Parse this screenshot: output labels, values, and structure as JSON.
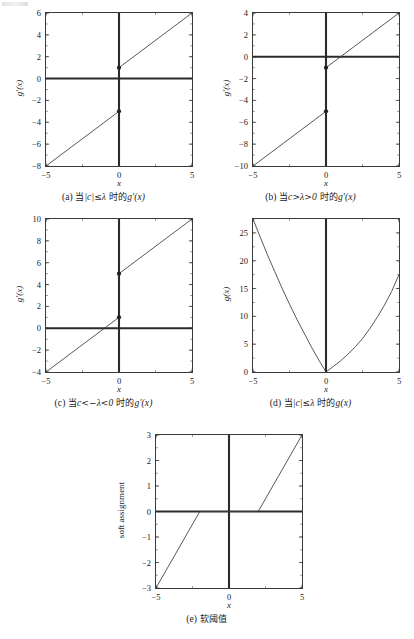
{
  "figure": {
    "title_visible": false,
    "panel_count": 5,
    "line_color": "#3a3a3a",
    "axis_color": "#2b2b2b",
    "marker_color": "#222222"
  },
  "panels": [
    {
      "id": "a",
      "tag": "(a)",
      "caption_parts": [
        "(a)",
        "当",
        "|c|≤λ",
        "时的",
        "g'(x)"
      ],
      "caption": "(a) 当|c|≤λ 时的g'(x)",
      "xlabel": "x",
      "ylabel": "g'(x)",
      "xticks": [
        "-5",
        "0",
        "5"
      ],
      "yticks": [
        "6",
        "4",
        "2",
        "0",
        "-2",
        "-4",
        "-6",
        "-8"
      ],
      "xlim": [
        -5,
        5
      ],
      "ylim": [
        -8,
        6
      ]
    },
    {
      "id": "b",
      "tag": "(b)",
      "caption_parts": [
        "(b)",
        "当",
        "c>λ>0",
        "时的",
        "g'(x)"
      ],
      "caption": "(b) 当c>λ>0 时的g'(x)",
      "xlabel": "x",
      "ylabel": "g'(x)",
      "xticks": [
        "-5",
        "0",
        "5"
      ],
      "yticks": [
        "4",
        "2",
        "0",
        "-2",
        "-4",
        "-6",
        "-8",
        "-10"
      ],
      "xlim": [
        -5,
        5
      ],
      "ylim": [
        -10,
        4
      ]
    },
    {
      "id": "c",
      "tag": "(c)",
      "caption_parts": [
        "(c)",
        "当",
        "c<-λ<0",
        "时的",
        "g'(x)"
      ],
      "caption": "(c) 当c<-λ<0 时的g'(x)",
      "xlabel": "x",
      "ylabel": "g'(x)",
      "xticks": [
        "-5",
        "0",
        "5"
      ],
      "yticks": [
        "10",
        "8",
        "6",
        "4",
        "2",
        "0",
        "-2",
        "-4"
      ],
      "xlim": [
        -5,
        5
      ],
      "ylim": [
        -4,
        10
      ]
    },
    {
      "id": "d",
      "tag": "(d)",
      "caption_parts": [
        "(d)",
        "当",
        "|c|≤λ",
        "时的",
        "g(x)"
      ],
      "caption": "(d) 当|c|≤λ 时的g(x)",
      "xlabel": "x",
      "ylabel": "g(x)",
      "xticks": [
        "-5",
        "0",
        "5"
      ],
      "yticks": [
        "25",
        "20",
        "15",
        "10",
        "5",
        "0"
      ],
      "xlim": [
        -5,
        5
      ],
      "ylim": [
        0,
        27.5
      ]
    },
    {
      "id": "e",
      "tag": "(e)",
      "caption_parts": [
        "(e)",
        "软阈值"
      ],
      "caption": "(e) 软阈值",
      "xlabel": "x",
      "ylabel": "soft assignment",
      "xticks": [
        "-5",
        "0",
        "5"
      ],
      "yticks": [
        "3",
        "2",
        "1",
        "0",
        "-1",
        "-2",
        "-3"
      ],
      "xlim": [
        -5,
        5
      ],
      "ylim": [
        -3,
        3
      ]
    }
  ],
  "chart_data": [
    {
      "type": "line",
      "panel": "a",
      "title": "(a) 当|c|≤λ 时的g'(x)",
      "xlabel": "x",
      "ylabel": "g'(x)",
      "xlim": [
        -5,
        5
      ],
      "ylim": [
        -8,
        6
      ],
      "xticks": [
        -5,
        0,
        5
      ],
      "yticks": [
        -8,
        -6,
        -4,
        -2,
        0,
        2,
        4,
        6
      ],
      "grid": false,
      "legend": "none",
      "series": [
        {
          "name": "left-branch",
          "x": [
            -5,
            0
          ],
          "y": [
            -8,
            -3
          ]
        },
        {
          "name": "right-branch",
          "x": [
            0,
            5
          ],
          "y": [
            1,
            6
          ]
        }
      ],
      "markers": [
        {
          "x": 0,
          "y": -3
        },
        {
          "x": 0,
          "y": 1
        }
      ],
      "reference_lines": [
        {
          "name": "x-axis",
          "type": "horizontal",
          "value": 0
        },
        {
          "name": "y-axis",
          "type": "vertical",
          "value": 0
        }
      ]
    },
    {
      "type": "line",
      "panel": "b",
      "title": "(b) 当c>λ>0 时的g'(x)",
      "xlabel": "x",
      "ylabel": "g'(x)",
      "xlim": [
        -5,
        5
      ],
      "ylim": [
        -10,
        4
      ],
      "xticks": [
        -5,
        0,
        5
      ],
      "yticks": [
        -10,
        -8,
        -6,
        -4,
        -2,
        0,
        2,
        4
      ],
      "grid": false,
      "legend": "none",
      "series": [
        {
          "name": "left-branch",
          "x": [
            -5,
            0
          ],
          "y": [
            -10,
            -5
          ]
        },
        {
          "name": "right-branch",
          "x": [
            0,
            5
          ],
          "y": [
            -1,
            4
          ]
        }
      ],
      "markers": [
        {
          "x": 0,
          "y": -5
        },
        {
          "x": 0,
          "y": -1
        }
      ],
      "reference_lines": [
        {
          "name": "x-axis",
          "type": "horizontal",
          "value": 0
        },
        {
          "name": "y-axis",
          "type": "vertical",
          "value": 0
        }
      ]
    },
    {
      "type": "line",
      "panel": "c",
      "title": "(c) 当c<-λ<0 时的g'(x)",
      "xlabel": "x",
      "ylabel": "g'(x)",
      "xlim": [
        -5,
        5
      ],
      "ylim": [
        -4,
        10
      ],
      "xticks": [
        -5,
        0,
        5
      ],
      "yticks": [
        -4,
        -2,
        0,
        2,
        4,
        6,
        8,
        10
      ],
      "grid": false,
      "legend": "none",
      "series": [
        {
          "name": "left-branch",
          "x": [
            -5,
            0
          ],
          "y": [
            -4,
            1
          ]
        },
        {
          "name": "right-branch",
          "x": [
            0,
            5
          ],
          "y": [
            5,
            10
          ]
        }
      ],
      "markers": [
        {
          "x": 0,
          "y": 1
        },
        {
          "x": 0,
          "y": 5
        }
      ],
      "reference_lines": [
        {
          "name": "x-axis",
          "type": "horizontal",
          "value": 0
        },
        {
          "name": "y-axis",
          "type": "vertical",
          "value": 0
        }
      ]
    },
    {
      "type": "line",
      "panel": "d",
      "title": "(d) 当|c|≤λ 时的g(x)",
      "xlabel": "x",
      "ylabel": "g(x)",
      "xlim": [
        -5,
        5
      ],
      "ylim": [
        0,
        27.5
      ],
      "xticks": [
        -5,
        0,
        5
      ],
      "yticks": [
        0,
        5,
        10,
        15,
        20,
        25
      ],
      "grid": false,
      "legend": "none",
      "series": [
        {
          "name": "g(x)",
          "x": [
            -5,
            -4.5,
            -4,
            -3.5,
            -3,
            -2.5,
            -2,
            -1.5,
            -1,
            -0.5,
            0,
            0.5,
            1,
            1.5,
            2,
            2.5,
            3,
            3.5,
            4,
            4.5,
            5
          ],
          "y": [
            27.5,
            24.2,
            21.0,
            18.0,
            15.0,
            12.2,
            9.5,
            7.0,
            4.5,
            2.2,
            0.0,
            1.0,
            2.0,
            3.2,
            4.5,
            6.0,
            7.8,
            9.8,
            12.0,
            14.5,
            17.5
          ]
        }
      ],
      "markers": [],
      "reference_lines": [
        {
          "name": "y-axis",
          "type": "vertical",
          "value": 0
        }
      ]
    },
    {
      "type": "line",
      "panel": "e",
      "title": "(e) 软阈值",
      "xlabel": "x",
      "ylabel": "soft assignment",
      "xlim": [
        -5,
        5
      ],
      "ylim": [
        -3,
        3
      ],
      "xticks": [
        -5,
        0,
        5
      ],
      "yticks": [
        -3,
        -2,
        -1,
        0,
        1,
        2,
        3
      ],
      "grid": false,
      "legend": "none",
      "threshold": 2,
      "series": [
        {
          "name": "soft-threshold",
          "x": [
            -5,
            -2,
            2,
            5
          ],
          "y": [
            -3,
            0,
            0,
            3
          ]
        }
      ],
      "markers": [],
      "reference_lines": [
        {
          "name": "x-axis",
          "type": "horizontal",
          "value": 0
        },
        {
          "name": "y-axis",
          "type": "vertical",
          "value": 0
        }
      ]
    }
  ]
}
